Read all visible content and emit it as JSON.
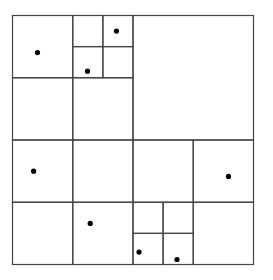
{
  "diagram": {
    "type": "quadtree",
    "colors": {
      "line": "#444444",
      "point": "#000000",
      "background": "#ffffff"
    },
    "bounds": {
      "xmin": 0,
      "ymin": 0,
      "xmax": 8,
      "ymax": 8
    },
    "cells": [
      {
        "id": "NW-NW",
        "x": 0,
        "y": 0,
        "w": 2,
        "h": 2
      },
      {
        "id": "NW-NE-NW",
        "x": 2,
        "y": 0,
        "w": 1,
        "h": 1
      },
      {
        "id": "NW-NE-NE",
        "x": 3,
        "y": 0,
        "w": 1,
        "h": 1
      },
      {
        "id": "NW-NE-SW",
        "x": 2,
        "y": 1,
        "w": 1,
        "h": 1
      },
      {
        "id": "NW-NE-SE",
        "x": 3,
        "y": 1,
        "w": 1,
        "h": 1
      },
      {
        "id": "NW-SW",
        "x": 0,
        "y": 2,
        "w": 2,
        "h": 2
      },
      {
        "id": "NW-SE",
        "x": 2,
        "y": 2,
        "w": 2,
        "h": 2
      },
      {
        "id": "NE",
        "x": 4,
        "y": 0,
        "w": 4,
        "h": 4
      },
      {
        "id": "SW-NW",
        "x": 0,
        "y": 4,
        "w": 2,
        "h": 2
      },
      {
        "id": "SW-NE",
        "x": 2,
        "y": 4,
        "w": 2,
        "h": 2
      },
      {
        "id": "SW-SW",
        "x": 0,
        "y": 6,
        "w": 2,
        "h": 2
      },
      {
        "id": "SW-SE",
        "x": 2,
        "y": 6,
        "w": 2,
        "h": 2
      },
      {
        "id": "SE-NW",
        "x": 4,
        "y": 4,
        "w": 2,
        "h": 2
      },
      {
        "id": "SE-NE",
        "x": 6,
        "y": 4,
        "w": 2,
        "h": 2
      },
      {
        "id": "SE-SW-NW",
        "x": 4,
        "y": 6,
        "w": 1,
        "h": 1
      },
      {
        "id": "SE-SW-NE",
        "x": 5,
        "y": 6,
        "w": 1,
        "h": 1
      },
      {
        "id": "SE-SW-SW",
        "x": 4,
        "y": 7,
        "w": 1,
        "h": 1
      },
      {
        "id": "SE-SW-SE",
        "x": 5,
        "y": 7,
        "w": 1,
        "h": 1
      },
      {
        "id": "SE-SE",
        "x": 6,
        "y": 6,
        "w": 2,
        "h": 2
      }
    ],
    "points": [
      {
        "x": 0.83,
        "y": 1.19
      },
      {
        "x": 3.45,
        "y": 0.5
      },
      {
        "x": 2.49,
        "y": 1.79
      },
      {
        "x": 0.7,
        "y": 5.0
      },
      {
        "x": 7.17,
        "y": 5.17
      },
      {
        "x": 2.58,
        "y": 6.68
      },
      {
        "x": 4.2,
        "y": 7.6
      },
      {
        "x": 5.46,
        "y": 7.84
      }
    ]
  }
}
